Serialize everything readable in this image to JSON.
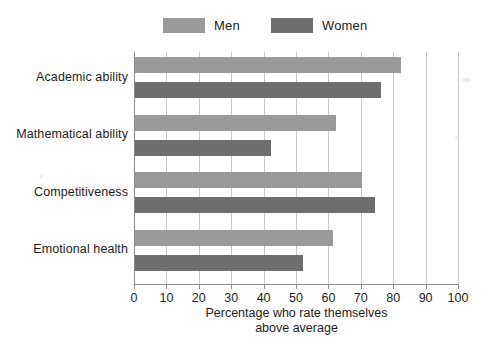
{
  "legend": {
    "items": [
      {
        "label": "Men",
        "color": "#9a9a9a",
        "name": "legend-men"
      },
      {
        "label": "Women",
        "color": "#6e6e6e",
        "name": "legend-women"
      }
    ]
  },
  "axis": {
    "x": {
      "title_line1": "Percentage who rate themselves",
      "title_line2": "above average",
      "ticks": [
        "0",
        "10",
        "20",
        "30",
        "40",
        "50",
        "60",
        "70",
        "80",
        "90",
        "100"
      ],
      "min": 0,
      "max": 100,
      "step": 10
    },
    "y": {
      "categories": [
        "Academic ability",
        "Mathematical ability",
        "Competitiveness",
        "Emotional health"
      ]
    }
  },
  "chart_data": {
    "type": "bar",
    "orientation": "horizontal",
    "title": "",
    "subtitle": "",
    "xlabel": "Percentage who rate themselves above average",
    "ylabel": "",
    "xlim": [
      0,
      100
    ],
    "xticks": [
      0,
      10,
      20,
      30,
      40,
      50,
      60,
      70,
      80,
      90,
      100
    ],
    "grid": "vertical",
    "legend_position": "top-center",
    "categories": [
      "Academic ability",
      "Mathematical ability",
      "Competitiveness",
      "Emotional health"
    ],
    "series": [
      {
        "name": "Men",
        "color": "#9a9a9a",
        "values": [
          82,
          62,
          70,
          61
        ]
      },
      {
        "name": "Women",
        "color": "#6e6e6e",
        "values": [
          76,
          42,
          74,
          52
        ]
      }
    ],
    "annotations": []
  }
}
